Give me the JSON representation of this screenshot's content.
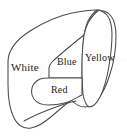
{
  "figure": {
    "type": "anatomical-outline-diagram",
    "background_color": "#ffffff",
    "stroke_color": "#4a4a4a",
    "text_color": "#1c1c1c",
    "width_px": 127,
    "height_px": 137,
    "regions": [
      {
        "id": "white",
        "label": "White",
        "fill_color": "#ffffff",
        "position": "left",
        "description": "large left lobe region"
      },
      {
        "id": "blue",
        "label": "Blue",
        "fill_color": "#ffffff",
        "position": "center-upper",
        "description": "central wedge region above Red"
      },
      {
        "id": "yellow",
        "label": "Yellow",
        "fill_color": "#ffffff",
        "position": "right",
        "description": "right vertical lobe region"
      },
      {
        "id": "red",
        "label": "Red",
        "fill_color": "#ffffff",
        "position": "center-lower",
        "description": "central lower rounded region below Blue"
      }
    ]
  }
}
